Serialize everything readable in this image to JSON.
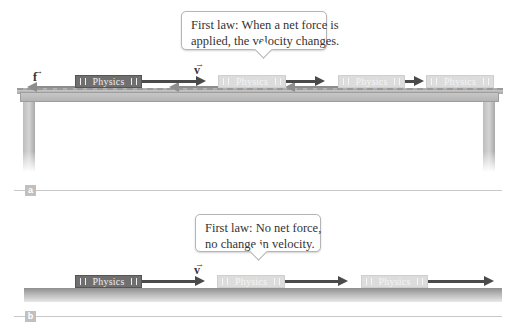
{
  "panel_a": {
    "tag": "a",
    "callout": {
      "line1": "First law: When a net force is",
      "line2": "applied, the velocity changes."
    },
    "velocity_label": "v",
    "friction_label": "f",
    "book_label": "Physics",
    "books": [
      {
        "state": "current",
        "label": "Physics"
      },
      {
        "state": "ghost",
        "label": "Physics"
      },
      {
        "state": "ghost",
        "label": "Physics"
      },
      {
        "state": "ghost",
        "label": "Physics"
      }
    ],
    "description": "Book sliding on table; friction f opposes velocity v, velocity arrows shrink"
  },
  "panel_b": {
    "tag": "b",
    "callout": {
      "line1": "First law: No net force,",
      "line2": "no change in velocity."
    },
    "velocity_label": "v",
    "books": [
      {
        "state": "current",
        "label": "Physics"
      },
      {
        "state": "ghost",
        "label": "Physics"
      },
      {
        "state": "ghost",
        "label": "Physics"
      }
    ],
    "description": "Book sliding on frictionless surface; velocity arrows equal length"
  },
  "colors": {
    "book_dark": "#6f6f6f",
    "book_ghost": "#dcdcdc",
    "arrow_velocity": "#4a4a4a",
    "arrow_friction": "#8d8d8d",
    "surface": "#b0b0b0"
  }
}
